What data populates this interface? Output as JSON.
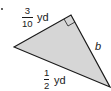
{
  "figure": {
    "type": "right-triangle",
    "fill_color": "#d6d6d6",
    "stroke_color": "#1a1a1a",
    "vertices": {
      "left": [
        14,
        47
      ],
      "right_angle": [
        71,
        15
      ],
      "bottom_right": [
        110,
        87
      ]
    },
    "right_angle_marker": true
  },
  "labels": {
    "leg_top": {
      "numerator": "3",
      "denominator": "10",
      "unit": "yd"
    },
    "hypotenuse": {
      "numerator": "1",
      "denominator": "2",
      "unit": "yd"
    },
    "leg_right": {
      "variable": "b"
    }
  },
  "marker": {
    "bullet": "."
  }
}
